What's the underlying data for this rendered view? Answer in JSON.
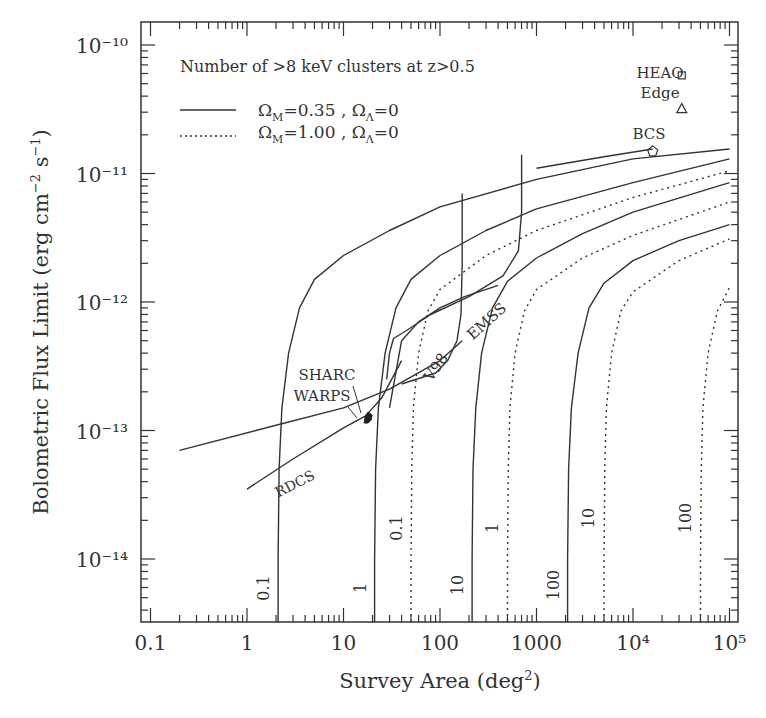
{
  "chart_data": {
    "type": "line",
    "title": "Number of >8 keV clusters at z>0.5",
    "xlabel": "Survey Area (deg²)",
    "ylabel": "Bolometric Flux Limit (erg cm⁻² s⁻¹)",
    "xscale": "log",
    "yscale": "log",
    "xlim": [
      0.09,
      120000
    ],
    "ylim": [
      3e-15,
      1.5e-10
    ],
    "grid": false,
    "legend_position": "upper-left",
    "x_tick_labels": [
      "0.1",
      "1",
      "10",
      "100",
      "1000",
      "10⁴",
      "10⁵"
    ],
    "x_ticks": [
      0.1,
      1,
      10,
      100,
      1000,
      10000,
      100000
    ],
    "y_tick_labels": [
      "10⁻¹⁴",
      "10⁻¹³",
      "10⁻¹²",
      "10⁻¹¹",
      "10⁻¹⁰"
    ],
    "y_ticks": [
      1e-14,
      1e-13,
      1e-12,
      1e-11,
      1e-10
    ],
    "legend": [
      {
        "label": "ΩM=0.35 , ΩΛ=0",
        "style": "solid"
      },
      {
        "label": "ΩM=1.00 , ΩΛ=0",
        "style": "dotted"
      }
    ],
    "series": [
      {
        "name": "N=0.1 (ΩM=0.35)",
        "style": "solid",
        "label": "0.1",
        "points": [
          [
            2.1,
            3e-15
          ],
          [
            2.1,
            1e-14
          ],
          [
            2.15,
            5e-14
          ],
          [
            2.3,
            1.5e-13
          ],
          [
            2.7,
            4e-13
          ],
          [
            3.5,
            9e-13
          ],
          [
            5,
            1.5e-12
          ],
          [
            10,
            2.3e-12
          ],
          [
            30,
            3.6e-12
          ],
          [
            100,
            5.5e-12
          ],
          [
            1000,
            9e-12
          ],
          [
            10000,
            1.3e-11
          ],
          [
            100000,
            1.55e-11
          ]
        ]
      },
      {
        "name": "N=1 (ΩM=0.35)",
        "style": "solid",
        "label": "1",
        "points": [
          [
            21,
            3e-15
          ],
          [
            21,
            1e-14
          ],
          [
            21.5,
            5e-14
          ],
          [
            23,
            1.5e-13
          ],
          [
            27,
            4e-13
          ],
          [
            35,
            9e-13
          ],
          [
            50,
            1.5e-12
          ],
          [
            100,
            2.3e-12
          ],
          [
            300,
            3.6e-12
          ],
          [
            1000,
            5.3e-12
          ],
          [
            10000,
            8.5e-12
          ],
          [
            100000,
            1.3e-11
          ]
        ]
      },
      {
        "name": "N=10 (ΩM=0.35)",
        "style": "solid",
        "label": "10",
        "points": [
          [
            215,
            3e-15
          ],
          [
            215,
            1e-14
          ],
          [
            220,
            5e-14
          ],
          [
            235,
            1.5e-13
          ],
          [
            270,
            4e-13
          ],
          [
            350,
            9e-13
          ],
          [
            500,
            1.45e-12
          ],
          [
            1000,
            2.2e-12
          ],
          [
            3000,
            3.4e-12
          ],
          [
            10000,
            5e-12
          ],
          [
            100000,
            8.5e-12
          ]
        ]
      },
      {
        "name": "N=100 (ΩM=0.35)",
        "style": "solid",
        "label": "100",
        "points": [
          [
            2100,
            3e-15
          ],
          [
            2100,
            1e-14
          ],
          [
            2150,
            5e-14
          ],
          [
            2300,
            1.5e-13
          ],
          [
            2700,
            4e-13
          ],
          [
            3500,
            9e-13
          ],
          [
            5000,
            1.4e-12
          ],
          [
            10000,
            2.1e-12
          ],
          [
            30000,
            3e-12
          ],
          [
            100000,
            4e-12
          ]
        ]
      },
      {
        "name": "N=0.1 (ΩM=1.00)",
        "style": "dotted",
        "label": "0.1",
        "points": [
          [
            50,
            3e-15
          ],
          [
            50,
            1e-14
          ],
          [
            51,
            5e-14
          ],
          [
            53,
            1.5e-13
          ],
          [
            60,
            4e-13
          ],
          [
            75,
            8.5e-13
          ],
          [
            100,
            1.25e-12
          ],
          [
            300,
            2.3e-12
          ],
          [
            1000,
            3.6e-12
          ],
          [
            10000,
            6.5e-12
          ],
          [
            100000,
            1.05e-11
          ]
        ]
      },
      {
        "name": "N=1 (ΩM=1.00)",
        "style": "dotted",
        "label": "1",
        "points": [
          [
            500,
            3e-15
          ],
          [
            500,
            1e-14
          ],
          [
            510,
            5e-14
          ],
          [
            530,
            1.5e-13
          ],
          [
            600,
            4e-13
          ],
          [
            750,
            8.5e-13
          ],
          [
            1000,
            1.25e-12
          ],
          [
            3000,
            2.2e-12
          ],
          [
            10000,
            3.3e-12
          ],
          [
            100000,
            6e-12
          ]
        ]
      },
      {
        "name": "N=10 (ΩM=1.00)",
        "style": "dotted",
        "label": "10",
        "points": [
          [
            5000,
            3e-15
          ],
          [
            5000,
            1e-14
          ],
          [
            5100,
            5e-14
          ],
          [
            5300,
            1.5e-13
          ],
          [
            6000,
            4e-13
          ],
          [
            7500,
            8.5e-13
          ],
          [
            10000,
            1.2e-12
          ],
          [
            30000,
            2.1e-12
          ],
          [
            100000,
            3.1e-12
          ]
        ]
      },
      {
        "name": "N=100 (ΩM=1.00)",
        "style": "dotted",
        "label": "100",
        "points": [
          [
            50000,
            3e-15
          ],
          [
            50000,
            1e-14
          ],
          [
            51000,
            5e-14
          ],
          [
            53000,
            1.5e-13
          ],
          [
            60000,
            4e-13
          ],
          [
            75000,
            8.5e-13
          ],
          [
            100000,
            1.3e-12
          ]
        ]
      }
    ],
    "surveys": [
      {
        "name": "RDCS",
        "style": "solid",
        "points": [
          [
            1,
            3.5e-14
          ],
          [
            3,
            6e-14
          ],
          [
            10,
            1.05e-13
          ],
          [
            17,
            1.3e-13
          ],
          [
            25,
            1.8e-13
          ],
          [
            40,
            3.5e-13
          ]
        ]
      },
      {
        "name": "SHARC/WARPS",
        "style": "solid",
        "points": [
          [
            0.2,
            7e-14
          ],
          [
            2,
            1.1e-13
          ],
          [
            10,
            1.5e-13
          ],
          [
            30,
            2.1e-13
          ],
          [
            100,
            3.5e-13
          ],
          [
            170,
            5e-13
          ]
        ]
      },
      {
        "name": "V98",
        "style": "solid",
        "points": [
          [
            30,
            1.5e-13
          ],
          [
            40,
            5e-13
          ],
          [
            60,
            7e-13
          ],
          [
            100,
            9e-13
          ],
          [
            180,
            1.1e-12
          ],
          [
            400,
            1.35e-12
          ]
        ]
      },
      {
        "name": "V98-edge",
        "style": "solid",
        "points": [
          [
            170,
            7e-12
          ],
          [
            170,
            2e-12
          ],
          [
            165,
            8e-13
          ],
          [
            150,
            5e-13
          ],
          [
            120,
            3.5e-13
          ],
          [
            90,
            2.8e-13
          ],
          [
            40,
            2.3e-13
          ]
        ]
      },
      {
        "name": "EMSS",
        "style": "solid",
        "points": [
          [
            700,
            1.4e-11
          ],
          [
            700,
            5e-12
          ],
          [
            650,
            2.5e-12
          ],
          [
            450,
            1.6e-12
          ],
          [
            200,
            1.1e-12
          ],
          [
            80,
            8e-13
          ],
          [
            45,
            6e-13
          ],
          [
            33,
            5.2e-13
          ],
          [
            30,
            4e-13
          ],
          [
            28,
            2.5e-13
          ]
        ]
      },
      {
        "name": "BCS",
        "style": "solid",
        "points": [
          [
            1000,
            1.1e-11
          ],
          [
            5000,
            1.35e-11
          ],
          [
            16000,
            1.55e-11
          ]
        ]
      }
    ],
    "markers": [
      {
        "name": "HEAO",
        "shape": "square",
        "x": 32000,
        "y": 5.8e-11
      },
      {
        "name": "Edge",
        "shape": "triangle",
        "x": 32000,
        "y": 3.2e-11
      },
      {
        "name": "BCS",
        "shape": "pentagon",
        "x": 16000,
        "y": 1.5e-11
      },
      {
        "name": "SHARC/WARPS",
        "shape": "filled-blob",
        "x": 18,
        "y": 1.25e-13
      }
    ],
    "annotations": [
      "SHARC",
      "WARPS",
      "RDCS",
      "V98",
      "EMSS",
      "BCS",
      "HEAO",
      "Edge"
    ]
  },
  "labels": {
    "legend_title": "Number of >8 keV clusters at z>0.5",
    "legend_om1": "0.35",
    "legend_om2": "1.00",
    "xlabel_main": "Survey Area (deg",
    "xlabel_sup": "2",
    "xlabel_end": ")",
    "ylabel_main": "Bolometric Flux Limit (erg cm",
    "ylabel_sup1": "−2",
    "ylabel_mid": " s",
    "ylabel_sup2": "−1",
    "ylabel_end": ")"
  }
}
